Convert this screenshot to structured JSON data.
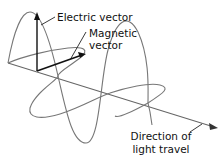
{
  "diagram": {
    "labels": {
      "electric_vector": "Electric vector",
      "magnetic_vector_line1": "Magnetic",
      "magnetic_vector_line2": "vector",
      "direction_line1": "Direction of",
      "direction_line2": "light travel"
    },
    "colors": {
      "wave_stroke": "#777777",
      "vector_stroke": "#111111",
      "axis_stroke": "#666666",
      "text": "#111111",
      "background": "#ffffff"
    }
  }
}
